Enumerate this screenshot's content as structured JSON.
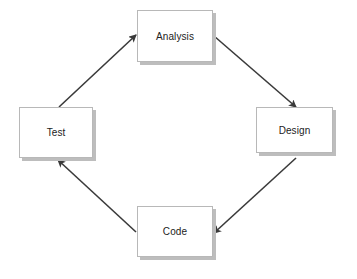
{
  "diagram": {
    "type": "cycle",
    "colors": {
      "arrow": "#3a3a3a",
      "box_border": "#b8b8b8",
      "box_shadow": "#bdbdbd",
      "text": "#222222"
    },
    "nodes": [
      {
        "id": "analysis",
        "label": "Analysis",
        "x": 137,
        "y": 10,
        "w": 76,
        "h": 52
      },
      {
        "id": "design",
        "label": "Design",
        "x": 256,
        "y": 107,
        "w": 77,
        "h": 46
      },
      {
        "id": "code",
        "label": "Code",
        "x": 137,
        "y": 206,
        "w": 76,
        "h": 51
      },
      {
        "id": "test",
        "label": "Test",
        "x": 19,
        "y": 107,
        "w": 74,
        "h": 51
      }
    ],
    "edges": [
      {
        "from": "test",
        "to": "analysis",
        "x1": 59,
        "y1": 107,
        "x2": 136,
        "y2": 35
      },
      {
        "from": "analysis",
        "to": "design",
        "x1": 214,
        "y1": 36,
        "x2": 296,
        "y2": 107
      },
      {
        "from": "design",
        "to": "code",
        "x1": 296,
        "y1": 158,
        "x2": 214,
        "y2": 233
      },
      {
        "from": "code",
        "to": "test",
        "x1": 136,
        "y1": 232,
        "x2": 58,
        "y2": 160
      }
    ]
  }
}
